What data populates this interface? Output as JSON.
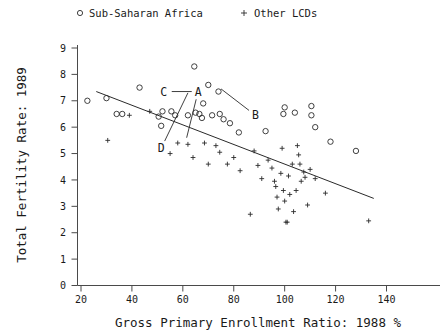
{
  "legend": {
    "position": "top",
    "entries": [
      {
        "label": "Sub-Saharan Africa",
        "marker": "circle-marker-icon"
      },
      {
        "label": "Other LCDs",
        "marker": "plus-marker-icon"
      }
    ]
  },
  "chart_data": {
    "type": "scatter",
    "title": "",
    "xlabel": "Gross Primary Enrollment Ratio: 1988 %",
    "ylabel": "Total Fertility Rate: 1989",
    "xlim": [
      14,
      146
    ],
    "ylim": [
      0,
      9.4
    ],
    "xticks": [
      20,
      40,
      60,
      80,
      100,
      120,
      140
    ],
    "yticks": [
      0,
      1,
      2,
      3,
      4,
      5,
      6,
      7,
      8,
      9
    ],
    "grid": false,
    "legend_position": "top",
    "series": [
      {
        "name": "Sub-Saharan Africa",
        "marker": "circle",
        "points": [
          [
            22.5,
            7.0
          ],
          [
            30.0,
            7.1
          ],
          [
            34.0,
            6.5
          ],
          [
            36.2,
            6.5
          ],
          [
            43.0,
            7.5
          ],
          [
            50.5,
            6.4
          ],
          [
            52.0,
            6.6
          ],
          [
            51.5,
            6.05
          ],
          [
            55.5,
            6.6
          ],
          [
            57.0,
            6.45
          ],
          [
            62.0,
            6.45
          ],
          [
            64.5,
            8.3
          ],
          [
            65.0,
            6.55
          ],
          [
            66.5,
            6.5
          ],
          [
            67.5,
            6.35
          ],
          [
            68.0,
            6.9
          ],
          [
            70.0,
            7.6
          ],
          [
            71.5,
            6.45
          ],
          [
            74.0,
            7.35
          ],
          [
            74.5,
            6.5
          ],
          [
            76.0,
            6.3
          ],
          [
            78.5,
            6.15
          ],
          [
            82.0,
            5.8
          ],
          [
            92.5,
            5.85
          ],
          [
            99.5,
            6.5
          ],
          [
            100.0,
            6.75
          ],
          [
            104.0,
            6.55
          ],
          [
            110.5,
            6.8
          ],
          [
            110.5,
            6.45
          ],
          [
            112.0,
            6.0
          ],
          [
            118.0,
            5.45
          ],
          [
            128.0,
            5.1
          ]
        ]
      },
      {
        "name": "Other LCDs",
        "marker": "plus",
        "points": [
          [
            30.5,
            5.5
          ],
          [
            39.0,
            6.45
          ],
          [
            47.0,
            6.6
          ],
          [
            55.0,
            5.0
          ],
          [
            58.0,
            5.4
          ],
          [
            62.0,
            5.35
          ],
          [
            64.0,
            4.85
          ],
          [
            68.5,
            5.4
          ],
          [
            70.0,
            4.6
          ],
          [
            73.0,
            5.3
          ],
          [
            74.5,
            5.05
          ],
          [
            77.5,
            4.6
          ],
          [
            80.0,
            4.85
          ],
          [
            82.5,
            4.35
          ],
          [
            86.5,
            2.7
          ],
          [
            88.0,
            5.1
          ],
          [
            89.5,
            4.55
          ],
          [
            91.0,
            4.05
          ],
          [
            93.5,
            4.75
          ],
          [
            95.0,
            4.45
          ],
          [
            96.0,
            3.95
          ],
          [
            96.5,
            3.75
          ],
          [
            97.0,
            3.35
          ],
          [
            97.5,
            2.9
          ],
          [
            98.5,
            4.25
          ],
          [
            99.0,
            5.2
          ],
          [
            99.5,
            3.6
          ],
          [
            100.0,
            3.2
          ],
          [
            100.5,
            2.4
          ],
          [
            101.0,
            2.4
          ],
          [
            101.5,
            4.15
          ],
          [
            102.0,
            3.45
          ],
          [
            103.0,
            4.6
          ],
          [
            103.5,
            2.8
          ],
          [
            104.5,
            3.6
          ],
          [
            105.0,
            5.3
          ],
          [
            105.5,
            4.95
          ],
          [
            106.0,
            4.6
          ],
          [
            106.5,
            3.95
          ],
          [
            107.5,
            4.3
          ],
          [
            108.0,
            4.1
          ],
          [
            109.0,
            3.05
          ],
          [
            110.0,
            4.4
          ],
          [
            112.0,
            4.05
          ],
          [
            116.0,
            3.5
          ],
          [
            133.0,
            2.45
          ]
        ]
      }
    ],
    "fit_line": {
      "x": [
        26.0,
        135.0
      ],
      "y": [
        7.35,
        3.3
      ]
    },
    "annotations": [
      {
        "label": "A",
        "x": 66.0,
        "y": 7.35,
        "leader_to": [
          61.5,
          5.6
        ]
      },
      {
        "label": "B",
        "x": 88.5,
        "y": 6.45,
        "leader_to": [
          75.0,
          7.45
        ]
      },
      {
        "label": "C",
        "x": 52.5,
        "y": 7.35,
        "leader_to": [
          63.5,
          7.35
        ]
      },
      {
        "label": "D",
        "x": 51.5,
        "y": 5.2,
        "leader_to": [
          62.0,
          7.3
        ]
      }
    ]
  }
}
